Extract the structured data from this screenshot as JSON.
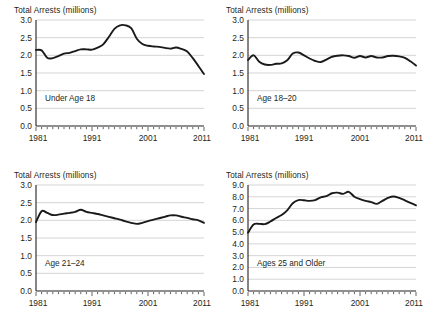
{
  "figure": {
    "background_color": "#ffffff",
    "line_color": "#1a1a1a",
    "grid_color": "#b8b8b8",
    "axis_color": "#231f20"
  },
  "panels": [
    {
      "id": "under-age-18",
      "title": "Total Arrests (millions)",
      "series_label": "Under Age 18",
      "ytick_labels": [
        "0.0",
        "0.5",
        "1.0",
        "1.5",
        "2.0",
        "2.5",
        "3.0"
      ],
      "xtick_labels": [
        "1981",
        "1991",
        "2001",
        "2011"
      ]
    },
    {
      "id": "age-18-20",
      "title": "Total Arrests (millions)",
      "series_label": "Age 18–20",
      "ytick_labels": [
        "0.0",
        "0.5",
        "1.0",
        "1.5",
        "2.0",
        "2.5",
        "3.0"
      ],
      "xtick_labels": [
        "1981",
        "1991",
        "2001",
        "2011"
      ]
    },
    {
      "id": "age-21-24",
      "title": "Total Arrests (millions)",
      "series_label": "Age 21–24",
      "ytick_labels": [
        "0.0",
        "0.5",
        "1.0",
        "1.5",
        "2.0",
        "2.5",
        "3.0"
      ],
      "xtick_labels": [
        "1981",
        "1991",
        "2001",
        "2011"
      ]
    },
    {
      "id": "ages-25-and-older",
      "title": "Total Arrests (millions)",
      "series_label": "Ages 25 and Older",
      "ytick_labels": [
        "0.0",
        "1.0",
        "2.0",
        "3.0",
        "4.0",
        "5.0",
        "6.0",
        "7.0",
        "8.0",
        "9.0"
      ],
      "xtick_labels": [
        "1981",
        "1991",
        "2001",
        "2011"
      ]
    }
  ],
  "chart_data": [
    {
      "type": "line",
      "id": "under-age-18",
      "title": "Total Arrests (millions)",
      "subtitle": "Under Age 18",
      "xlabel": "",
      "ylabel": "Total Arrests (millions)",
      "xlim": [
        1981,
        2011
      ],
      "ylim": [
        0.0,
        3.0
      ],
      "ytick_step": 0.5,
      "xticks": [
        1981,
        1991,
        2001,
        2011
      ],
      "grid": true,
      "legend": "none",
      "x": [
        1981,
        1982,
        1983,
        1984,
        1985,
        1986,
        1987,
        1988,
        1989,
        1990,
        1991,
        1992,
        1993,
        1994,
        1995,
        1996,
        1997,
        1998,
        1999,
        2000,
        2001,
        2002,
        2003,
        2004,
        2005,
        2006,
        2007,
        2008,
        2009,
        2010,
        2011
      ],
      "values": [
        2.15,
        2.14,
        1.93,
        1.92,
        1.98,
        2.05,
        2.07,
        2.12,
        2.17,
        2.17,
        2.16,
        2.22,
        2.31,
        2.52,
        2.75,
        2.85,
        2.85,
        2.77,
        2.47,
        2.32,
        2.27,
        2.25,
        2.24,
        2.21,
        2.19,
        2.22,
        2.18,
        2.11,
        1.92,
        1.7,
        1.47
      ]
    },
    {
      "type": "line",
      "id": "age-18-20",
      "title": "Total Arrests (millions)",
      "subtitle": "Age 18–20",
      "xlabel": "",
      "ylabel": "Total Arrests (millions)",
      "xlim": [
        1981,
        2011
      ],
      "ylim": [
        0.0,
        3.0
      ],
      "ytick_step": 0.5,
      "xticks": [
        1981,
        1991,
        2001,
        2011
      ],
      "grid": true,
      "legend": "none",
      "x": [
        1981,
        1982,
        1983,
        1984,
        1985,
        1986,
        1987,
        1988,
        1989,
        1990,
        1991,
        1992,
        1993,
        1994,
        1995,
        1996,
        1997,
        1998,
        1999,
        2000,
        2001,
        2002,
        2003,
        2004,
        2005,
        2006,
        2007,
        2008,
        2009,
        2010,
        2011
      ],
      "values": [
        1.87,
        2.0,
        1.82,
        1.74,
        1.73,
        1.76,
        1.77,
        1.86,
        2.05,
        2.08,
        2.0,
        1.91,
        1.84,
        1.81,
        1.88,
        1.96,
        1.99,
        2.0,
        1.98,
        1.93,
        1.98,
        1.94,
        1.98,
        1.94,
        1.94,
        1.98,
        1.99,
        1.97,
        1.93,
        1.83,
        1.71
      ]
    },
    {
      "type": "line",
      "id": "age-21-24",
      "title": "Total Arrests (millions)",
      "subtitle": "Age 21–24",
      "xlabel": "",
      "ylabel": "Total Arrests (millions)",
      "xlim": [
        1981,
        2011
      ],
      "ylim": [
        0.0,
        3.0
      ],
      "ytick_step": 0.5,
      "xticks": [
        1981,
        1991,
        2001,
        2011
      ],
      "grid": true,
      "legend": "none",
      "x": [
        1981,
        1982,
        1983,
        1984,
        1985,
        1986,
        1987,
        1988,
        1989,
        1990,
        1991,
        1992,
        1993,
        1994,
        1995,
        1996,
        1997,
        1998,
        1999,
        2000,
        2001,
        2002,
        2003,
        2004,
        2005,
        2006,
        2007,
        2008,
        2009,
        2010,
        2011
      ],
      "values": [
        1.95,
        2.26,
        2.21,
        2.15,
        2.16,
        2.19,
        2.21,
        2.24,
        2.3,
        2.24,
        2.21,
        2.18,
        2.14,
        2.1,
        2.06,
        2.02,
        1.97,
        1.93,
        1.9,
        1.93,
        1.98,
        2.02,
        2.06,
        2.1,
        2.14,
        2.14,
        2.1,
        2.07,
        2.03,
        2.0,
        1.93
      ]
    },
    {
      "type": "line",
      "id": "ages-25-and-older",
      "title": "Total Arrests (millions)",
      "subtitle": "Ages 25 and Older",
      "xlabel": "",
      "ylabel": "Total Arrests (millions)",
      "xlim": [
        1981,
        2011
      ],
      "ylim": [
        0.0,
        9.0
      ],
      "ytick_step": 1.0,
      "xticks": [
        1981,
        1991,
        2001,
        2011
      ],
      "grid": true,
      "legend": "none",
      "x": [
        1981,
        1982,
        1983,
        1984,
        1985,
        1986,
        1987,
        1988,
        1989,
        1990,
        1991,
        1992,
        1993,
        1994,
        1995,
        1996,
        1997,
        1998,
        1999,
        2000,
        2001,
        2002,
        2003,
        2004,
        2005,
        2006,
        2007,
        2008,
        2009,
        2010,
        2011
      ],
      "values": [
        4.95,
        5.65,
        5.7,
        5.68,
        5.9,
        6.2,
        6.45,
        6.85,
        7.45,
        7.72,
        7.7,
        7.65,
        7.72,
        7.95,
        8.05,
        8.3,
        8.35,
        8.25,
        8.42,
        8.0,
        7.8,
        7.65,
        7.55,
        7.4,
        7.65,
        7.9,
        8.02,
        7.9,
        7.7,
        7.48,
        7.28
      ]
    }
  ]
}
